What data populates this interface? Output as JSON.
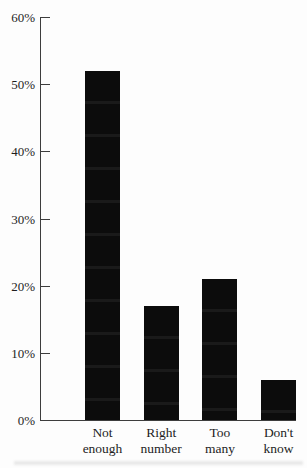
{
  "chart_data": {
    "type": "bar",
    "categories": [
      "Not enough",
      "Right number",
      "Too many",
      "Don't know"
    ],
    "values": [
      52,
      17,
      21,
      6
    ],
    "title": "",
    "xlabel": "",
    "ylabel": "",
    "ylim": [
      0,
      60
    ],
    "ytick_step": 10,
    "ytick_labels": [
      "0%",
      "10%",
      "20%",
      "30%",
      "40%",
      "50%",
      "60%"
    ],
    "grid": false,
    "legend": "none",
    "bar_color": "#0c0c0c",
    "axis_color": "#3d3d3d",
    "text_color": "#1e1e1e"
  }
}
